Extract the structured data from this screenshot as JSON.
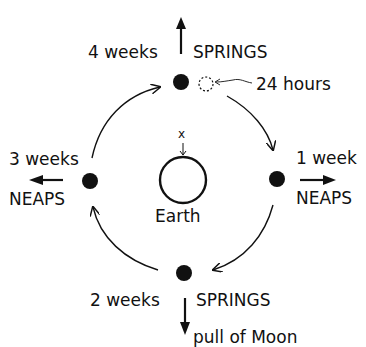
{
  "diagram": {
    "center": {
      "label": "Earth",
      "marker": "x"
    },
    "positions": [
      {
        "id": "top",
        "time": "4 weeks",
        "tide": "SPRINGS",
        "arrow": "up"
      },
      {
        "id": "right",
        "time": "1 week",
        "tide": "NEAPS",
        "arrow": "right"
      },
      {
        "id": "bottom",
        "time": "2 weeks",
        "tide": "SPRINGS",
        "arrow": "down"
      },
      {
        "id": "left",
        "time": "3 weeks",
        "tide": "NEAPS",
        "arrow": "left"
      }
    ],
    "annotation": {
      "label": "24 hours",
      "icon": "dashed-moon-icon"
    },
    "pull_label": "pull of Moon",
    "colors": {
      "ink": "#111111",
      "background": "#ffffff"
    }
  }
}
